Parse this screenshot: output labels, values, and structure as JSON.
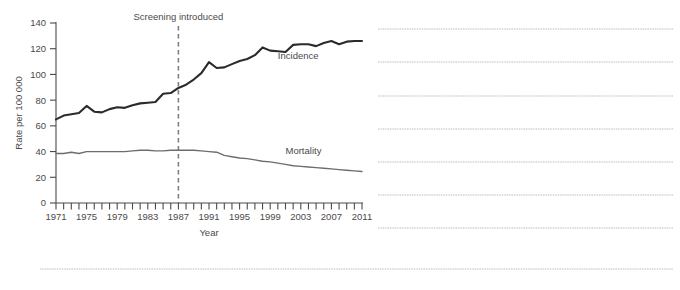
{
  "chart_data": {
    "type": "line",
    "title": "",
    "xlabel": "Year",
    "ylabel": "Rate per 100 000",
    "xlim": [
      1971,
      2011
    ],
    "ylim": [
      0,
      140
    ],
    "yticks": [
      0,
      20,
      40,
      60,
      80,
      100,
      120,
      140
    ],
    "xticks_labeled": [
      1971,
      1975,
      1979,
      1983,
      1987,
      1991,
      1995,
      1999,
      2003,
      2007,
      2011
    ],
    "xtick_interval_minor": 1,
    "grid": false,
    "legend": "inline-labels",
    "x": [
      1971,
      1972,
      1973,
      1974,
      1975,
      1976,
      1977,
      1978,
      1979,
      1980,
      1981,
      1982,
      1983,
      1984,
      1985,
      1986,
      1987,
      1988,
      1989,
      1990,
      1991,
      1992,
      1993,
      1994,
      1995,
      1996,
      1997,
      1998,
      1999,
      2000,
      2001,
      2002,
      2003,
      2004,
      2005,
      2006,
      2007,
      2008,
      2009,
      2010,
      2011
    ],
    "series": [
      {
        "name": "Incidence",
        "color": "#2b2b2b",
        "values": [
          65,
          68,
          69,
          70,
          75.5,
          71,
          70.5,
          73,
          74.5,
          74,
          76,
          77.5,
          78,
          78.5,
          85,
          85.5,
          89.5,
          92,
          96,
          101,
          109.5,
          105,
          105.5,
          108,
          110.5,
          112,
          115,
          121,
          118.5,
          118,
          117.5,
          123,
          123.5,
          123.5,
          122,
          124.5,
          126,
          123.5,
          125.5,
          126,
          126
        ]
      },
      {
        "name": "Mortality",
        "color": "#6d6d6d",
        "values": [
          38.5,
          38.5,
          39.5,
          38.5,
          40,
          40,
          40,
          40,
          40,
          40,
          40.5,
          41,
          41,
          40.5,
          40.5,
          41,
          41,
          41,
          41,
          40.5,
          40,
          39.5,
          37,
          36,
          35,
          34.5,
          33.5,
          32.5,
          32,
          31,
          30,
          29,
          28.5,
          28,
          27.5,
          27,
          26.5,
          26,
          25.5,
          25,
          24.5
        ]
      }
    ],
    "annotations": [
      {
        "name": "screening-introduced",
        "label": "Screening introduced",
        "x": 1987,
        "line_style": "dashed",
        "color": "#808080"
      }
    ],
    "series_labels": [
      {
        "name": "Incidence",
        "label": "Incidence",
        "x": 2000,
        "y": 112
      },
      {
        "name": "Mortality",
        "label": "Mortality",
        "x": 2001,
        "y": 38
      }
    ]
  },
  "redacted_block": {
    "note": "",
    "lines_right": [
      29,
      62,
      96,
      129,
      162,
      195,
      228
    ],
    "line_bottom": 269
  }
}
